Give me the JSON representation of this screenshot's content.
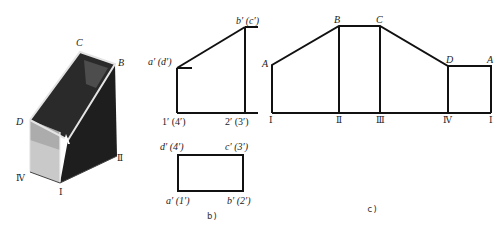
{
  "figure_a": {
    "vertex_labels": {
      "C": "C",
      "B": "B",
      "D": "D",
      "IV": "Ⅳ",
      "I": "Ⅰ",
      "II": "Ⅱ"
    },
    "face_label": "A",
    "colors": {
      "dark_face": "#1a1a1a",
      "light_face": "#cfcfcf",
      "edge": "#e8e8e8"
    }
  },
  "figure_b": {
    "caption": "b)",
    "front_view": {
      "labels": {
        "top_left": "a′ (d′)",
        "top_right": "b′ (c′)",
        "bottom_left": "1′ (4′)",
        "bottom_right": "2′ (3′)"
      }
    },
    "top_view": {
      "labels": {
        "top_left": "d′ (4′)",
        "top_right": "c′ (3′)",
        "bottom_left": "a′ (1′)",
        "bottom_right": "b′ (2′)"
      }
    }
  },
  "figure_c": {
    "caption": "c)",
    "top_labels": [
      "A",
      "B",
      "C",
      "D",
      "A"
    ],
    "bottom_labels": [
      "Ⅰ",
      "Ⅱ",
      "Ⅲ",
      "Ⅳ",
      "Ⅰ"
    ]
  },
  "line_color": "#111111"
}
